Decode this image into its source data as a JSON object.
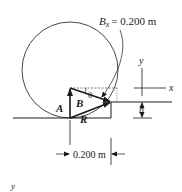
{
  "diagram": {
    "title_label": {
      "symbol": "B",
      "subscript": "x",
      "value": "= 0.200 m"
    },
    "vectors": [
      {
        "name": "A",
        "label": "A"
      },
      {
        "name": "B",
        "label": "B"
      },
      {
        "name": "R",
        "label": "R"
      }
    ],
    "angle_label": "θ",
    "axes": {
      "x_label": "x",
      "y_label": "y"
    },
    "height_label": "h",
    "width_dimension": "0.200 m",
    "footer_label": "y",
    "colors": {
      "ink": "#1a1a1a",
      "background": "#ffffff"
    }
  }
}
